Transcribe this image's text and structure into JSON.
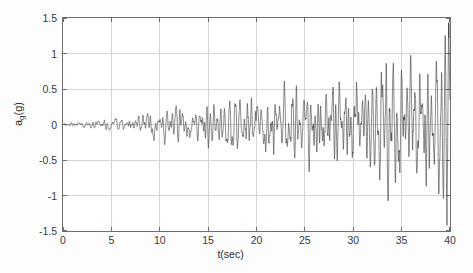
{
  "chart_data": {
    "type": "line",
    "title": "",
    "xlabel": "t(sec)",
    "ylabel_main": "a",
    "ylabel_sub": "g",
    "ylabel_suffix": "(g)",
    "ylabel_text": "a_g(g)",
    "xlim": [
      0,
      40
    ],
    "ylim": [
      -1.5,
      1.5
    ],
    "xticks": [
      0,
      5,
      10,
      15,
      20,
      25,
      30,
      35,
      40
    ],
    "xtick_labels": [
      "0",
      "5",
      "10",
      "15",
      "20",
      "25",
      "30",
      "35",
      "40"
    ],
    "yticks": [
      1.5,
      1,
      0.5,
      0,
      -0.5,
      -1,
      -1.5
    ],
    "ytick_labels": [
      "1.5",
      "1",
      "0.5",
      "0",
      "-0.5",
      "-1",
      "-1.5"
    ],
    "grid": true,
    "grid_color": "#d4d4d4",
    "axis_color": "#6f6f6f",
    "line_color": "#3b3b3b",
    "line_width": 0.6,
    "background": "#ffffff",
    "legend": null,
    "series": [
      {
        "name": "ground acceleration",
        "description": "Non-stationary earthquake ground acceleration time history; amplitude envelope grows roughly linearly from near zero at t=0 to about 1.2 g peaks near t=40 s.",
        "sample_rate_hz": 50,
        "duration_sec": 40,
        "peak_positive": 1.22,
        "peak_negative": -1.42,
        "envelope_breakpoints": {
          "t": [
            0,
            2,
            5,
            8,
            10,
            13,
            16,
            20,
            24,
            28,
            32,
            36,
            40
          ],
          "amp": [
            0.02,
            0.06,
            0.11,
            0.16,
            0.22,
            0.3,
            0.38,
            0.5,
            0.62,
            0.75,
            0.9,
            1.05,
            1.2
          ]
        },
        "dominant_freq_hz": 2.6,
        "seed": 20240117
      }
    ]
  }
}
